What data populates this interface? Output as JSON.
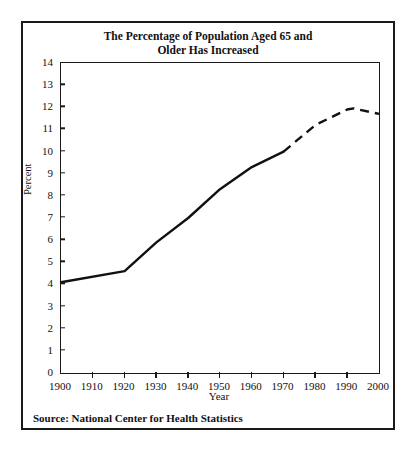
{
  "chart_data": {
    "type": "line",
    "title": "The Percentage of Population Aged 65 and Older Has Increased",
    "title_line1": "The Percentage of Population Aged 65 and",
    "title_line2": "Older Has Increased",
    "xlabel": "Year",
    "ylabel": "Percent",
    "source": "Source: National Center for Health Statistics",
    "xlim": [
      1900,
      2000
    ],
    "ylim": [
      0,
      14
    ],
    "grid": false,
    "legend": null,
    "xticks": [
      1900,
      1910,
      1920,
      1930,
      1940,
      1950,
      1960,
      1970,
      1980,
      1990,
      2000
    ],
    "yticks": [
      0,
      1,
      2,
      3,
      4,
      5,
      6,
      7,
      8,
      9,
      10,
      11,
      12,
      13,
      14
    ],
    "series": [
      {
        "name": "Percentage of population aged 65 and older",
        "style": "solid",
        "note": "historical",
        "x": [
          1900,
          1920,
          1930,
          1940,
          1950,
          1960,
          1970
        ],
        "values": [
          4.1,
          4.6,
          5.9,
          7.0,
          8.3,
          9.3,
          10.0
        ]
      },
      {
        "name": "Percentage of population aged 65 and older (projected)",
        "style": "dashed",
        "note": "projected",
        "x": [
          1970,
          1980,
          1990,
          1992,
          2000
        ],
        "values": [
          10.0,
          11.2,
          11.9,
          11.95,
          11.7
        ]
      }
    ],
    "line_color": "#111111",
    "line_width": 2.4
  },
  "colors": {
    "ink": "#111111",
    "frame": "#1a1a1a",
    "background": "#ffffff"
  }
}
